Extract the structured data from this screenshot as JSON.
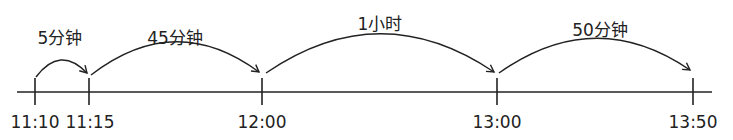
{
  "timeline": {
    "ticks": [
      {
        "label": "11:10",
        "x": 35
      },
      {
        "label": "11:15",
        "x": 89
      },
      {
        "label": "12:00",
        "x": 262
      },
      {
        "label": "13:00",
        "x": 497
      },
      {
        "label": "13:50",
        "x": 693
      }
    ],
    "intervals": [
      {
        "label": "5分钟",
        "from": "11:10",
        "to": "11:15"
      },
      {
        "label": "45分钟",
        "from": "11:15",
        "to": "12:00"
      },
      {
        "label": "1小时",
        "from": "12:00",
        "to": "13:00"
      },
      {
        "label": "50分钟",
        "from": "13:00",
        "to": "13:50"
      }
    ]
  }
}
